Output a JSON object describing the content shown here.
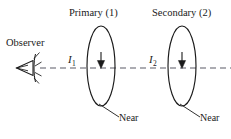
{
  "figure": {
    "name": "rainbow-observation-geometry",
    "background_color": "#ffffff",
    "ink_color": "#1a1a1a",
    "axis_color": "#5a5a66",
    "width": 231,
    "height": 139
  },
  "labels": {
    "primary_title": "Primary (1)",
    "secondary_title": "Secondary (2)",
    "observer": "Observer",
    "current_1": "I",
    "current_1_sub": "1",
    "current_2": "I",
    "current_2_sub": "2",
    "near_1": "Near",
    "near_2": "Near"
  },
  "icons": {
    "eye": "eye-icon",
    "arrowhead_1": "down-arrowhead-icon",
    "arrowhead_2": "down-arrowhead-icon"
  },
  "geometry": {
    "axis_y": 68,
    "axis_start_x": 40,
    "axis_end_x": 231,
    "axis_dash": "6 4",
    "ellipse_1": {
      "cx": 101,
      "cy": 66,
      "rx": 14,
      "ry": 40
    },
    "ellipse_2": {
      "cx": 182,
      "cy": 66,
      "rx": 14,
      "ry": 40
    },
    "leader_1": {
      "x1": 99,
      "y1": 104,
      "x2": 119,
      "y2": 117
    },
    "leader_2": {
      "x1": 180,
      "y1": 104,
      "x2": 200,
      "y2": 117
    },
    "eye": {
      "cx": 27,
      "cy": 67
    }
  }
}
